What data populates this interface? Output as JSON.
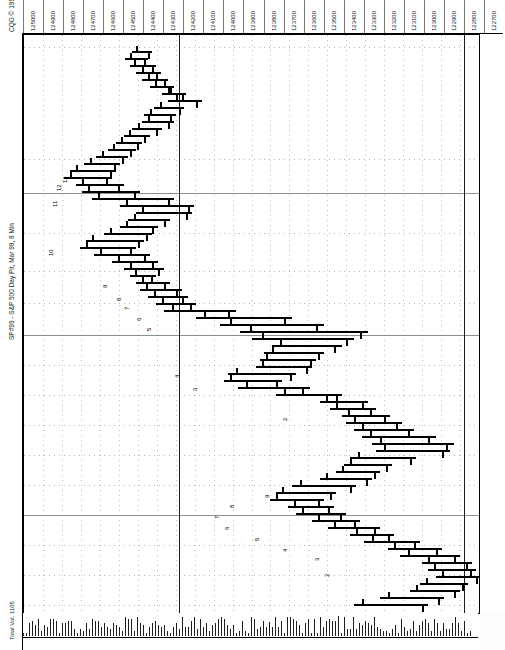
{
  "window": {
    "header_tag": "CQG © 1999",
    "title": "SP#99 - S&P 500 Day Pit, Mar 99, 8 Min",
    "footer_tag": "Total Vol. 1105"
  },
  "chart_data": {
    "type": "bar",
    "chart_kind": "ohlc-bar-rotated",
    "title": "SP#99 - S&P 500 Day Pit, Mar 99, 8 Min",
    "xlabel": "Price",
    "ylabel": "Time",
    "grid": true,
    "legend": "none",
    "orientation": "rotated-90-ccw",
    "price_axis": {
      "position": "top",
      "ticks": [
        "125000",
        "124900",
        "124800",
        "124700",
        "124600",
        "124500",
        "124400",
        "124300",
        "124200",
        "124100",
        "124000",
        "123900",
        "123800",
        "123700",
        "123600",
        "123500",
        "123400",
        "123300",
        "123200",
        "123100",
        "123000",
        "122900",
        "122800",
        "122700"
      ],
      "min": 122700,
      "max": 125000,
      "step": 100
    },
    "time_axis": {
      "position": "right",
      "ticks": [
        "04-11:02",
        "10:30",
        "10:26",
        "09:34",
        "09:02",
        "08-09:30",
        "15:02",
        "14:30",
        "14:04",
        "13:34",
        "13:02",
        "12:30",
        "12:06",
        "11:34",
        "11:02"
      ]
    },
    "annotations": [
      {
        "label": "13",
        "y": 172
      },
      {
        "label": "12",
        "y": 180
      },
      {
        "label": "11",
        "y": 196
      },
      {
        "label": "10",
        "y": 245
      },
      {
        "label": "9",
        "y": 277
      },
      {
        "label": "8",
        "y": 290
      },
      {
        "label": "7",
        "y": 299
      },
      {
        "label": "6",
        "y": 310
      },
      {
        "label": "5",
        "y": 320
      },
      {
        "label": "4",
        "y": 367
      },
      {
        "label": "3",
        "y": 380
      },
      {
        "label": "2",
        "y": 410
      },
      {
        "label": "9",
        "y": 487
      },
      {
        "label": "8",
        "y": 497
      },
      {
        "label": "7",
        "y": 508
      },
      {
        "label": "6",
        "y": 519
      },
      {
        "label": "5",
        "y": 530
      },
      {
        "label": "4",
        "y": 541
      },
      {
        "label": "3",
        "y": 550
      },
      {
        "label": "2",
        "y": 566
      }
    ],
    "bars": [
      {
        "y": 50,
        "x1": 108,
        "x2": 128,
        "open": 112,
        "close": 124
      },
      {
        "y": 57,
        "x1": 101,
        "x2": 124,
        "open": 106,
        "close": 120
      },
      {
        "y": 64,
        "x1": 106,
        "x2": 132,
        "open": 110,
        "close": 128
      },
      {
        "y": 71,
        "x1": 112,
        "x2": 137,
        "open": 118,
        "close": 132
      },
      {
        "y": 78,
        "x1": 118,
        "x2": 144,
        "open": 124,
        "close": 140
      },
      {
        "y": 85,
        "x1": 126,
        "x2": 150,
        "open": 131,
        "close": 146
      },
      {
        "y": 92,
        "x1": 138,
        "x2": 162,
        "open": 144,
        "close": 158
      },
      {
        "y": 99,
        "x1": 144,
        "x2": 178,
        "open": 152,
        "close": 172
      },
      {
        "y": 106,
        "x1": 130,
        "x2": 160,
        "open": 136,
        "close": 155
      },
      {
        "y": 113,
        "x1": 120,
        "x2": 152,
        "open": 126,
        "close": 146
      },
      {
        "y": 120,
        "x1": 118,
        "x2": 150,
        "open": 124,
        "close": 144
      },
      {
        "y": 127,
        "x1": 108,
        "x2": 138,
        "open": 114,
        "close": 132
      },
      {
        "y": 134,
        "x1": 100,
        "x2": 126,
        "open": 105,
        "close": 120
      },
      {
        "y": 141,
        "x1": 92,
        "x2": 118,
        "open": 97,
        "close": 113
      },
      {
        "y": 148,
        "x1": 84,
        "x2": 112,
        "open": 89,
        "close": 106
      },
      {
        "y": 155,
        "x1": 72,
        "x2": 104,
        "open": 78,
        "close": 98
      },
      {
        "y": 162,
        "x1": 60,
        "x2": 96,
        "open": 66,
        "close": 90
      },
      {
        "y": 169,
        "x1": 46,
        "x2": 92,
        "open": 52,
        "close": 86
      },
      {
        "y": 176,
        "x1": 40,
        "x2": 88,
        "open": 46,
        "close": 82
      },
      {
        "y": 183,
        "x1": 52,
        "x2": 100,
        "open": 58,
        "close": 94
      },
      {
        "y": 190,
        "x1": 58,
        "x2": 116,
        "open": 64,
        "close": 110
      },
      {
        "y": 197,
        "x1": 68,
        "x2": 150,
        "open": 74,
        "close": 144
      },
      {
        "y": 204,
        "x1": 96,
        "x2": 170,
        "open": 102,
        "close": 164
      },
      {
        "y": 211,
        "x1": 112,
        "x2": 168,
        "open": 118,
        "close": 162
      },
      {
        "y": 218,
        "x1": 104,
        "x2": 146,
        "open": 110,
        "close": 140
      },
      {
        "y": 225,
        "x1": 96,
        "x2": 134,
        "open": 102,
        "close": 128
      },
      {
        "y": 232,
        "x1": 80,
        "x2": 128,
        "open": 86,
        "close": 122
      },
      {
        "y": 239,
        "x1": 62,
        "x2": 120,
        "open": 68,
        "close": 114
      },
      {
        "y": 246,
        "x1": 56,
        "x2": 112,
        "open": 62,
        "close": 106
      },
      {
        "y": 253,
        "x1": 70,
        "x2": 126,
        "open": 76,
        "close": 120
      },
      {
        "y": 260,
        "x1": 88,
        "x2": 134,
        "open": 94,
        "close": 128
      },
      {
        "y": 267,
        "x1": 100,
        "x2": 140,
        "open": 106,
        "close": 134
      },
      {
        "y": 274,
        "x1": 106,
        "x2": 132,
        "open": 111,
        "close": 127
      },
      {
        "y": 281,
        "x1": 112,
        "x2": 146,
        "open": 118,
        "close": 140
      },
      {
        "y": 288,
        "x1": 116,
        "x2": 158,
        "open": 122,
        "close": 152
      },
      {
        "y": 295,
        "x1": 124,
        "x2": 164,
        "open": 130,
        "close": 158
      },
      {
        "y": 302,
        "x1": 132,
        "x2": 172,
        "open": 138,
        "close": 166
      },
      {
        "y": 309,
        "x1": 140,
        "x2": 212,
        "open": 148,
        "close": 204
      },
      {
        "y": 316,
        "x1": 172,
        "x2": 268,
        "open": 180,
        "close": 260
      },
      {
        "y": 323,
        "x1": 196,
        "x2": 300,
        "open": 206,
        "close": 292
      },
      {
        "y": 330,
        "x1": 216,
        "x2": 344,
        "open": 226,
        "close": 336
      },
      {
        "y": 337,
        "x1": 228,
        "x2": 330,
        "open": 238,
        "close": 322
      },
      {
        "y": 344,
        "x1": 248,
        "x2": 318,
        "open": 256,
        "close": 310
      },
      {
        "y": 351,
        "x1": 240,
        "x2": 300,
        "open": 248,
        "close": 294
      },
      {
        "y": 358,
        "x1": 236,
        "x2": 292,
        "open": 242,
        "close": 286
      },
      {
        "y": 365,
        "x1": 232,
        "x2": 288,
        "open": 238,
        "close": 282
      },
      {
        "y": 372,
        "x1": 204,
        "x2": 272,
        "open": 212,
        "close": 266
      },
      {
        "y": 379,
        "x1": 200,
        "x2": 258,
        "open": 206,
        "close": 252
      },
      {
        "y": 386,
        "x1": 214,
        "x2": 286,
        "open": 222,
        "close": 278
      },
      {
        "y": 393,
        "x1": 252,
        "x2": 318,
        "open": 260,
        "close": 312
      },
      {
        "y": 400,
        "x1": 296,
        "x2": 344,
        "open": 302,
        "close": 338
      },
      {
        "y": 407,
        "x1": 306,
        "x2": 352,
        "open": 312,
        "close": 346
      },
      {
        "y": 414,
        "x1": 318,
        "x2": 366,
        "open": 324,
        "close": 360
      },
      {
        "y": 421,
        "x1": 322,
        "x2": 378,
        "open": 330,
        "close": 372
      },
      {
        "y": 428,
        "x1": 330,
        "x2": 390,
        "open": 338,
        "close": 384
      },
      {
        "y": 435,
        "x1": 338,
        "x2": 412,
        "open": 346,
        "close": 404
      },
      {
        "y": 442,
        "x1": 348,
        "x2": 430,
        "open": 356,
        "close": 422
      },
      {
        "y": 449,
        "x1": 352,
        "x2": 426,
        "open": 360,
        "close": 418
      },
      {
        "y": 456,
        "x1": 326,
        "x2": 392,
        "open": 334,
        "close": 386
      },
      {
        "y": 463,
        "x1": 320,
        "x2": 368,
        "open": 326,
        "close": 362
      },
      {
        "y": 470,
        "x1": 312,
        "x2": 356,
        "open": 318,
        "close": 350
      },
      {
        "y": 477,
        "x1": 296,
        "x2": 348,
        "open": 302,
        "close": 342
      },
      {
        "y": 484,
        "x1": 268,
        "x2": 332,
        "open": 276,
        "close": 326
      },
      {
        "y": 491,
        "x1": 252,
        "x2": 312,
        "open": 258,
        "close": 306
      },
      {
        "y": 498,
        "x1": 246,
        "x2": 300,
        "open": 252,
        "close": 294
      },
      {
        "y": 505,
        "x1": 264,
        "x2": 310,
        "open": 270,
        "close": 304
      },
      {
        "y": 512,
        "x1": 272,
        "x2": 322,
        "open": 278,
        "close": 316
      },
      {
        "y": 519,
        "x1": 288,
        "x2": 336,
        "open": 294,
        "close": 330
      },
      {
        "y": 526,
        "x1": 304,
        "x2": 356,
        "open": 310,
        "close": 350
      },
      {
        "y": 533,
        "x1": 326,
        "x2": 370,
        "open": 332,
        "close": 364
      },
      {
        "y": 540,
        "x1": 340,
        "x2": 396,
        "open": 348,
        "close": 390
      },
      {
        "y": 547,
        "x1": 364,
        "x2": 418,
        "open": 370,
        "close": 412
      },
      {
        "y": 554,
        "x1": 376,
        "x2": 436,
        "open": 384,
        "close": 430
      },
      {
        "y": 561,
        "x1": 398,
        "x2": 448,
        "open": 404,
        "close": 442
      },
      {
        "y": 568,
        "x1": 404,
        "x2": 452,
        "open": 410,
        "close": 446
      },
      {
        "y": 575,
        "x1": 412,
        "x2": 458,
        "open": 418,
        "close": 452
      },
      {
        "y": 582,
        "x1": 396,
        "x2": 444,
        "open": 402,
        "close": 438
      },
      {
        "y": 589,
        "x1": 386,
        "x2": 436,
        "open": 392,
        "close": 430
      },
      {
        "y": 596,
        "x1": 356,
        "x2": 420,
        "open": 364,
        "close": 414
      },
      {
        "y": 603,
        "x1": 330,
        "x2": 404,
        "open": 338,
        "close": 398
      }
    ]
  }
}
